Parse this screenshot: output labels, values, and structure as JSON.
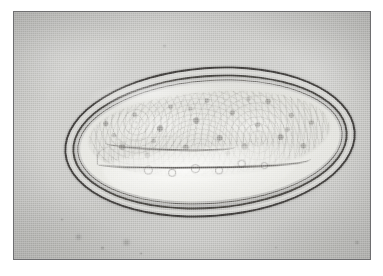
{
  "image": {
    "kind": "photomicrograph",
    "subject": "helminth ovum (parasite egg)",
    "caption": "",
    "frame": {
      "border_color": "#6e6e70",
      "page_background": "#ffffff"
    },
    "field": {
      "background_color": "#c9c9c7",
      "highlight_color": "#d3d3d0",
      "shadow_color": "#bcbcb9"
    },
    "ovum": {
      "shell_color": "#3e3c3a",
      "shell_inner_color": "#464441",
      "shell_gap_color": "#d6d6d2",
      "membrane_color": "#686663",
      "cavity_color": "#eeeeea",
      "embryo_color": "#dcdcd6",
      "larval_band_color": "#4a4845",
      "tilt_degrees": -4.2,
      "shell_wall_count": 3
    },
    "debris": [
      {
        "name": "debris-speck-1",
        "left": 61,
        "top": 222,
        "size": 7,
        "opacity": 0.62
      },
      {
        "name": "debris-speck-2",
        "left": 86,
        "top": 234,
        "size": 5,
        "opacity": 0.52
      },
      {
        "name": "debris-speck-3",
        "left": 108,
        "top": 227,
        "size": 9,
        "opacity": 0.58
      },
      {
        "name": "debris-speck-4",
        "left": 125,
        "top": 240,
        "size": 4,
        "opacity": 0.44
      },
      {
        "name": "debris-speck-5",
        "left": 46,
        "top": 206,
        "size": 4,
        "opacity": 0.4
      },
      {
        "name": "debris-speck-6",
        "left": 340,
        "top": 228,
        "size": 6,
        "opacity": 0.4
      },
      {
        "name": "debris-speck-7",
        "left": 356,
        "top": 45,
        "size": 4,
        "opacity": 0.34
      },
      {
        "name": "debris-speck-8",
        "left": 148,
        "top": 32,
        "size": 5,
        "opacity": 0.3
      },
      {
        "name": "debris-speck-9",
        "left": 196,
        "top": 247,
        "size": 5,
        "opacity": 0.34
      },
      {
        "name": "debris-speck-10",
        "left": 260,
        "top": 234,
        "size": 4,
        "opacity": 0.26
      }
    ],
    "vacuoles": [
      {
        "name": "vacuole-1",
        "left": 24,
        "top": 66,
        "size": 7
      },
      {
        "name": "vacuole-2",
        "left": 33,
        "top": 70,
        "size": 6
      },
      {
        "name": "vacuole-3",
        "left": 42,
        "top": 68,
        "size": 7
      },
      {
        "name": "vacuole-4",
        "left": 51,
        "top": 71,
        "size": 6
      },
      {
        "name": "vacuole-5",
        "left": 60,
        "top": 67,
        "size": 6
      },
      {
        "name": "vacuole-6",
        "left": 69,
        "top": 70,
        "size": 5
      }
    ]
  }
}
